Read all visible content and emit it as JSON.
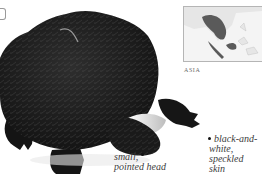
{
  "figure": {
    "map": {
      "region_label": "ASIA",
      "highlight_color": "#5a5a5a",
      "land_color": "#e6e6e6",
      "sea_color": "#f4f4f4"
    },
    "annotations": [
      {
        "id": "head",
        "line1": "small,",
        "line2": "pointed head"
      },
      {
        "id": "skin",
        "line1": "black-and-",
        "line2": "white, speckled",
        "line3": "skin"
      }
    ]
  }
}
